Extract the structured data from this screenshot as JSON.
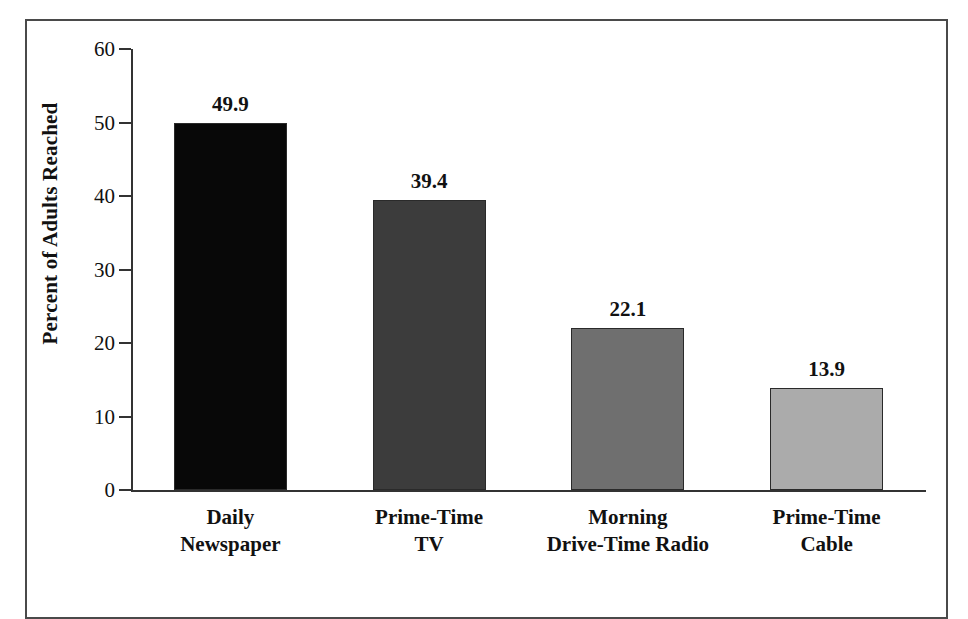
{
  "chart_data": {
    "type": "bar",
    "title": "",
    "xlabel": "",
    "ylabel": "Percent of Adults Reached",
    "ylim": [
      0,
      60
    ],
    "yticks": [
      0,
      10,
      20,
      30,
      40,
      50,
      60
    ],
    "ytick_labels": [
      "0",
      "10",
      "20",
      "30",
      "40",
      "50",
      "60"
    ],
    "grid": false,
    "legend": "none",
    "categories": [
      "Daily\nNewspaper",
      "Prime-Time\nTV",
      "Morning\nDrive-Time Radio",
      "Prime-Time\nCable"
    ],
    "values": [
      49.9,
      39.4,
      22.1,
      13.9
    ],
    "value_labels": [
      "49.9",
      "39.4",
      "22.1",
      "13.9"
    ],
    "bar_colors": [
      "#080808",
      "#3c3c3c",
      "#6f6f6f",
      "#ababab"
    ],
    "bar_edge_color": "#2a2a2a",
    "axis_color": "#333333",
    "frame_color": "#4a4a4a",
    "background": "#ffffff"
  }
}
